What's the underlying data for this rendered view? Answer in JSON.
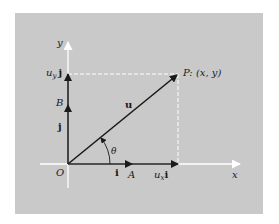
{
  "figure": {
    "background_color": "#ffffff",
    "panel_color": "#c9c9c9",
    "axis_color": "#ffffff",
    "vector_color": "#1a1a1a",
    "axes": {
      "x_label": "x",
      "y_label": "y",
      "origin_label": "O"
    },
    "point": {
      "label": "P: (x, y)"
    },
    "vectors": {
      "u": {
        "label": "u"
      },
      "i": {
        "label": "i",
        "endpoint_label": "A"
      },
      "j": {
        "label": "j",
        "endpoint_label": "B"
      },
      "ux_i": {
        "coef": "u",
        "sub": "x",
        "unit": "i"
      },
      "uy_j": {
        "coef": "u",
        "sub": "y",
        "unit": "j"
      }
    },
    "angle": {
      "label": "θ"
    }
  }
}
